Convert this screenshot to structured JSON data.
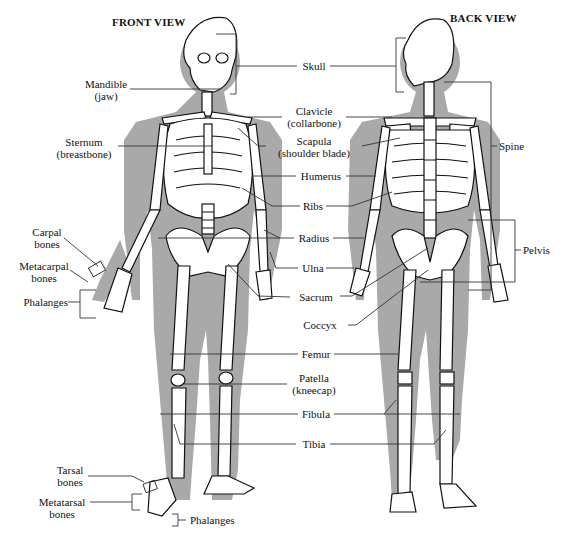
{
  "titles": {
    "front": "FRONT VIEW",
    "back": "BACK VIEW"
  },
  "labels": {
    "mandible": [
      "Mandible",
      "(jaw)"
    ],
    "sternum": [
      "Sternum",
      "(breastbone)"
    ],
    "carpal": [
      "Carpal",
      "bones"
    ],
    "metacarpal": [
      "Metacarpal",
      "bones"
    ],
    "phalanges_hand": [
      "Phalanges"
    ],
    "tarsal": [
      "Tarsal",
      "bones"
    ],
    "metatarsal": [
      "Metatarsal",
      "bones"
    ],
    "phalanges_foot": [
      "Phalanges"
    ],
    "skull": [
      "Skull"
    ],
    "clavicle": [
      "Clavicle",
      "(collarbone)"
    ],
    "scapula": [
      "Scapula",
      "(shoulder blade)"
    ],
    "humerus": [
      "Humerus"
    ],
    "ribs": [
      "Ribs"
    ],
    "radius": [
      "Radius"
    ],
    "ulna": [
      "Ulna"
    ],
    "sacrum": [
      "Sacrum"
    ],
    "coccyx": [
      "Coccyx"
    ],
    "femur": [
      "Femur"
    ],
    "patella": [
      "Patella",
      "(kneecap)"
    ],
    "fibula": [
      "Fibula"
    ],
    "tibia": [
      "Tibia"
    ],
    "spine": [
      "Spine"
    ],
    "pelvis": [
      "Pelvis"
    ]
  },
  "colors": {
    "silhouette": "#a9a9a9",
    "bone": "#ffffff",
    "ink": "#111111",
    "leader": "#333333"
  }
}
